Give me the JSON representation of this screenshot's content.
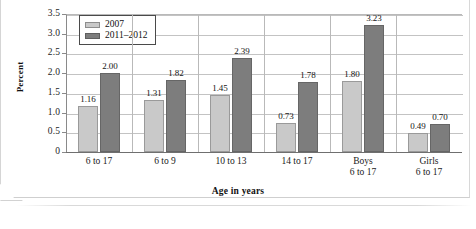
{
  "chart_data": {
    "type": "bar",
    "title": "",
    "xlabel": "Age in years",
    "ylabel": "Percent",
    "ylim": [
      0,
      3.5
    ],
    "ytick_labels": [
      "3.5",
      "3.0",
      "2.5",
      "2.0",
      "1.5",
      "1.0",
      "0.5",
      "0"
    ],
    "ytick_values": [
      3.5,
      3.0,
      2.5,
      2.0,
      1.5,
      1.0,
      0.5,
      0
    ],
    "grid": true,
    "legend_position": "top-left",
    "categories": [
      {
        "line1": "6 to 17",
        "line2": ""
      },
      {
        "line1": "6 to 9",
        "line2": ""
      },
      {
        "line1": "10 to 13",
        "line2": ""
      },
      {
        "line1": "14 to 17",
        "line2": ""
      },
      {
        "line1": "Boys",
        "line2": "6 to 17"
      },
      {
        "line1": "Girls",
        "line2": "6 to 17"
      }
    ],
    "series": [
      {
        "name": "2007",
        "color": "#c9c9c9",
        "values": [
          1.16,
          1.31,
          1.45,
          0.73,
          1.8,
          0.49
        ],
        "labels": [
          "1.16",
          "1.31",
          "1.45",
          "0.73",
          "1.80",
          "0.49"
        ]
      },
      {
        "name": "2011–2012",
        "color": "#7d7d7d",
        "values": [
          2.0,
          1.82,
          2.39,
          1.78,
          3.23,
          0.7
        ],
        "labels": [
          "2.00",
          "1.82",
          "2.39",
          "1.78",
          "3.23",
          "0.70"
        ]
      }
    ]
  }
}
